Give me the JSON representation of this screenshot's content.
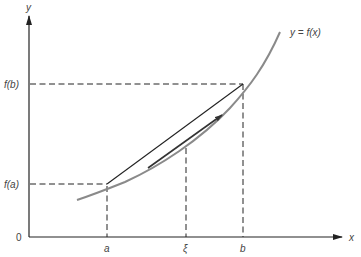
{
  "figure": {
    "axes": {
      "x_label": "x",
      "y_label": "y",
      "origin_label": "0"
    },
    "x_ticks": [
      {
        "label": "a",
        "x": 107
      },
      {
        "label": "ξ",
        "x": 186
      },
      {
        "label": "b",
        "x": 243
      }
    ],
    "y_ticks": [
      {
        "label": "f(b)",
        "y": 84
      },
      {
        "label": "f(a)",
        "y": 184
      }
    ],
    "curve_label": "y = f(x)",
    "elements": {
      "curve": "y = f(x), increasing convex curve",
      "chord": "secant line from (a, f(a)) to (b, f(b))",
      "tangent": "tangent line at ξ, parallel to chord, with arrow",
      "guides": "dashed lines marking a, b, ξ, f(a), f(b)"
    },
    "colors": {
      "axis": "#222222",
      "curve": "#8a8a8a",
      "chord": "#222222",
      "tangent": "#333333",
      "dashed": "#222222",
      "text": "#444444"
    }
  }
}
